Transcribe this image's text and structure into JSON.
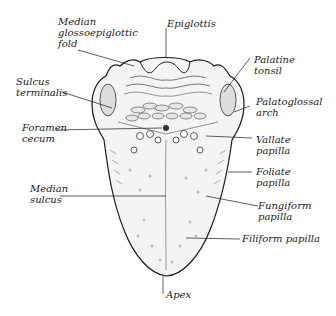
{
  "diagram": {
    "labels": {
      "median_glossoepiglottic_fold": "Median\nglossoepiglottic\nfold",
      "epiglottis": "Epiglottis",
      "palatine_tonsil": "Palatine\ntonsil",
      "sulcus_terminalis": "Sulcus\nterminalis",
      "palatoglossal_arch": "Palatoglossal\narch",
      "foramen_cecum": "Foramen\ncecum",
      "vallate_papilla": "Vallate\npapilla",
      "median_sulcus": "Median\nsulcus",
      "foliate_papilla": "Foliate\npapilla",
      "fungiform_papilla": "Fungiform\npapilla",
      "filiform_papilla": "Filiform papilla",
      "apex": "Apex"
    },
    "colors": {
      "line": "#1a1a1a",
      "fill": "#f4f4f4",
      "shade": "#bdbdbd"
    }
  }
}
